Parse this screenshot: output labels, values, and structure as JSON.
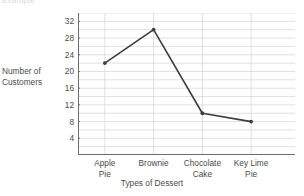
{
  "clipped_header_text": "Example",
  "chart_data": {
    "type": "line",
    "title": "",
    "xlabel": "Types of Dessert",
    "ylabel": "Number of Customers",
    "ylabel_lines": [
      "Number of",
      "Customers"
    ],
    "categories": [
      "Apple Pie",
      "Brownie",
      "Chocolate Cake",
      "Key Lime Pie"
    ],
    "category_lines": [
      [
        "Apple",
        "Pie"
      ],
      [
        "Brownie"
      ],
      [
        "Chocolate",
        "Cake"
      ],
      [
        "Key Lime",
        "Pie"
      ]
    ],
    "values": [
      22,
      30,
      10,
      8
    ],
    "ylim": [
      0,
      34
    ],
    "ytick_labels": [
      "32",
      "28",
      "24",
      "20",
      "16",
      "12",
      "8",
      "4"
    ],
    "ytick_values": [
      32,
      28,
      24,
      20,
      16,
      12,
      8,
      4
    ],
    "gridline_step": 2,
    "grid": true,
    "legend": "none",
    "line_color": "#3d3d3d",
    "grid_color": "#d8d8d8",
    "axis_color": "#6e6e6e",
    "marker": "dot"
  }
}
